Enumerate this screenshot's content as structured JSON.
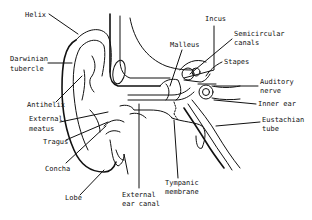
{
  "diagram": {
    "style": "black line drawing on white",
    "line_color": "#111111",
    "background": "#ffffff",
    "labels": [
      {
        "id": "helix",
        "text": "Helix",
        "x": 25,
        "y": 17
      },
      {
        "id": "darwinian-tubercle-1",
        "text": "Darwinian",
        "x": 10,
        "y": 61
      },
      {
        "id": "darwinian-tubercle-2",
        "text": "tubercle",
        "x": 10,
        "y": 71
      },
      {
        "id": "antihelix",
        "text": "Antihelix",
        "x": 27,
        "y": 107
      },
      {
        "id": "external-meatus-1",
        "text": "External",
        "x": 29,
        "y": 121
      },
      {
        "id": "external-meatus-2",
        "text": "meatus",
        "x": 29,
        "y": 131
      },
      {
        "id": "tragus",
        "text": "Tragus",
        "x": 43,
        "y": 144
      },
      {
        "id": "concha",
        "text": "Concha",
        "x": 45,
        "y": 171
      },
      {
        "id": "lobe",
        "text": "Lobe",
        "x": 65,
        "y": 200
      },
      {
        "id": "external-ear-canal-1",
        "text": "External",
        "x": 122,
        "y": 197
      },
      {
        "id": "external-ear-canal-2",
        "text": "ear canal",
        "x": 122,
        "y": 206
      },
      {
        "id": "tympanic-membrane-1",
        "text": "Tympanic",
        "x": 165,
        "y": 185
      },
      {
        "id": "tympanic-membrane-2",
        "text": "membrane",
        "x": 165,
        "y": 194
      },
      {
        "id": "malleus",
        "text": "Malleus",
        "x": 170,
        "y": 47
      },
      {
        "id": "incus",
        "text": "Incus",
        "x": 205,
        "y": 21
      },
      {
        "id": "semicircular-canals-1",
        "text": "Semicircular",
        "x": 234,
        "y": 36
      },
      {
        "id": "semicircular-canals-2",
        "text": "canals",
        "x": 234,
        "y": 45
      },
      {
        "id": "stapes",
        "text": "Stapes",
        "x": 224,
        "y": 64
      },
      {
        "id": "auditory-nerve-1",
        "text": "Auditory",
        "x": 260,
        "y": 84
      },
      {
        "id": "auditory-nerve-2",
        "text": "nerve",
        "x": 260,
        "y": 93
      },
      {
        "id": "inner-ear",
        "text": "Inner ear",
        "x": 258,
        "y": 106
      },
      {
        "id": "eustachian-tube-1",
        "text": "Eustachian",
        "x": 262,
        "y": 122
      },
      {
        "id": "eustachian-tube-2",
        "text": "tube",
        "x": 262,
        "y": 131
      }
    ]
  }
}
